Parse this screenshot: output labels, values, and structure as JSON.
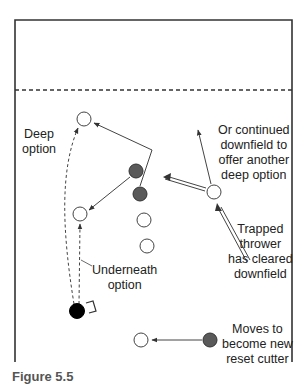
{
  "diagram": {
    "type": "ultimate-frisbee-field-play",
    "field": {
      "border_color": "#333333",
      "endzone_line": "dashed",
      "left": 15,
      "right": 292,
      "top": 20,
      "bottom": 362,
      "endzone_y": 90
    },
    "colors": {
      "offense_filled": "#5a5a5a",
      "thrower": "#000000",
      "open_player_fill": "#ffffff",
      "line": "#444444"
    },
    "players": [
      {
        "id": "deep-option-receiver",
        "x": 84,
        "y": 119,
        "style": "open"
      },
      {
        "id": "dark-cutter-1",
        "x": 136,
        "y": 171,
        "style": "gray"
      },
      {
        "id": "dark-cutter-2",
        "x": 140,
        "y": 194,
        "style": "gray"
      },
      {
        "id": "underneath-receiver",
        "x": 80,
        "y": 214,
        "style": "open"
      },
      {
        "id": "stack-player-1",
        "x": 144,
        "y": 220,
        "style": "open"
      },
      {
        "id": "stack-player-2",
        "x": 147,
        "y": 246,
        "style": "open"
      },
      {
        "id": "trapped-thrower-cleared",
        "x": 214,
        "y": 192,
        "style": "open"
      },
      {
        "id": "disc-holder",
        "x": 77,
        "y": 311,
        "style": "black"
      },
      {
        "id": "new-reset-target",
        "x": 141,
        "y": 340,
        "style": "open"
      },
      {
        "id": "reset-cutter",
        "x": 210,
        "y": 340,
        "style": "gray"
      }
    ],
    "labels": {
      "deep_option": [
        "Deep",
        "option"
      ],
      "continued_downfield": [
        "Or continued",
        "downfield to",
        "offer another",
        "deep option"
      ],
      "trapped_thrower": [
        "Trapped",
        "thrower",
        "has cleared",
        "downfield"
      ],
      "underneath_option": [
        "Underneath",
        "option"
      ],
      "new_reset": [
        "Moves to",
        "become new",
        "reset cutter"
      ]
    },
    "caption": "Figure 5.5"
  }
}
